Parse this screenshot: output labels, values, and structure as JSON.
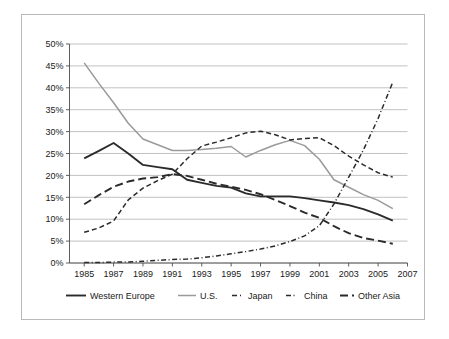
{
  "chart_data": {
    "type": "line",
    "title": "",
    "xlabel": "",
    "ylabel": "",
    "x": [
      1985,
      1986,
      1987,
      1988,
      1989,
      1990,
      1991,
      1992,
      1993,
      1994,
      1995,
      1996,
      1997,
      1998,
      1999,
      2000,
      2001,
      2002,
      2003,
      2004,
      2005,
      2006
    ],
    "xtick_labels": [
      "1985",
      "1987",
      "1989",
      "1991",
      "1993",
      "1995",
      "1997",
      "1999",
      "2001",
      "2003",
      "2005",
      "2007"
    ],
    "xlim": [
      1984,
      2007
    ],
    "ytick_labels": [
      "0%",
      "5%",
      "10%",
      "15%",
      "20%",
      "25%",
      "30%",
      "35%",
      "40%",
      "45%",
      "50%"
    ],
    "ytick_values": [
      0,
      5,
      10,
      15,
      20,
      25,
      30,
      35,
      40,
      45,
      50
    ],
    "ylim": [
      0,
      50
    ],
    "grid": true,
    "legend_position": "bottom",
    "series": [
      {
        "name": "Western Europe",
        "style": "solid",
        "color": "#2b2b2b",
        "width": 1.9,
        "values": [
          23.9,
          25.6,
          27.4,
          25.0,
          22.4,
          21.9,
          21.4,
          19.0,
          18.3,
          17.6,
          17.2,
          15.9,
          15.2,
          15.2,
          15.2,
          14.8,
          14.3,
          13.8,
          13.2,
          12.3,
          11.1,
          9.7
        ]
      },
      {
        "name": "U.S.",
        "style": "solid",
        "color": "#9a9a9a",
        "width": 1.5,
        "values": [
          45.7,
          41.0,
          36.6,
          31.9,
          28.3,
          27.0,
          25.7,
          25.7,
          25.9,
          26.2,
          26.6,
          24.2,
          25.7,
          27.0,
          28.0,
          26.8,
          23.7,
          19.0,
          17.3,
          15.6,
          14.3,
          12.4
        ]
      },
      {
        "name": "Japan",
        "style": "dashed",
        "color": "#2b2b2b",
        "width": 1.5,
        "values": [
          7.0,
          8.0,
          9.6,
          14.4,
          17.1,
          18.8,
          20.3,
          23.8,
          26.7,
          27.6,
          28.6,
          29.7,
          30.1,
          29.3,
          28.1,
          28.4,
          28.6,
          26.8,
          24.4,
          22.4,
          20.6,
          19.6
        ]
      },
      {
        "name": "China",
        "style": "dashdot",
        "color": "#2b2b2b",
        "width": 1.5,
        "values": [
          0.1,
          0.1,
          0.2,
          0.2,
          0.4,
          0.6,
          0.8,
          0.9,
          1.2,
          1.6,
          2.1,
          2.6,
          3.2,
          3.9,
          4.9,
          6.2,
          8.5,
          13.5,
          19.6,
          25.8,
          33.0,
          41.3
        ]
      },
      {
        "name": "Other Asia",
        "style": "longdash",
        "color": "#2b2b2b",
        "width": 1.9,
        "values": [
          13.4,
          15.5,
          17.4,
          18.6,
          19.3,
          19.6,
          20.3,
          19.9,
          19.0,
          18.1,
          17.4,
          16.7,
          15.7,
          14.4,
          13.0,
          11.5,
          10.3,
          8.4,
          6.8,
          5.7,
          5.1,
          4.4
        ]
      }
    ]
  },
  "legend": {
    "items": [
      {
        "label": "Western Europe"
      },
      {
        "label": "U.S."
      },
      {
        "label": "Japan"
      },
      {
        "label": "China"
      },
      {
        "label": "Other Asia"
      }
    ]
  }
}
